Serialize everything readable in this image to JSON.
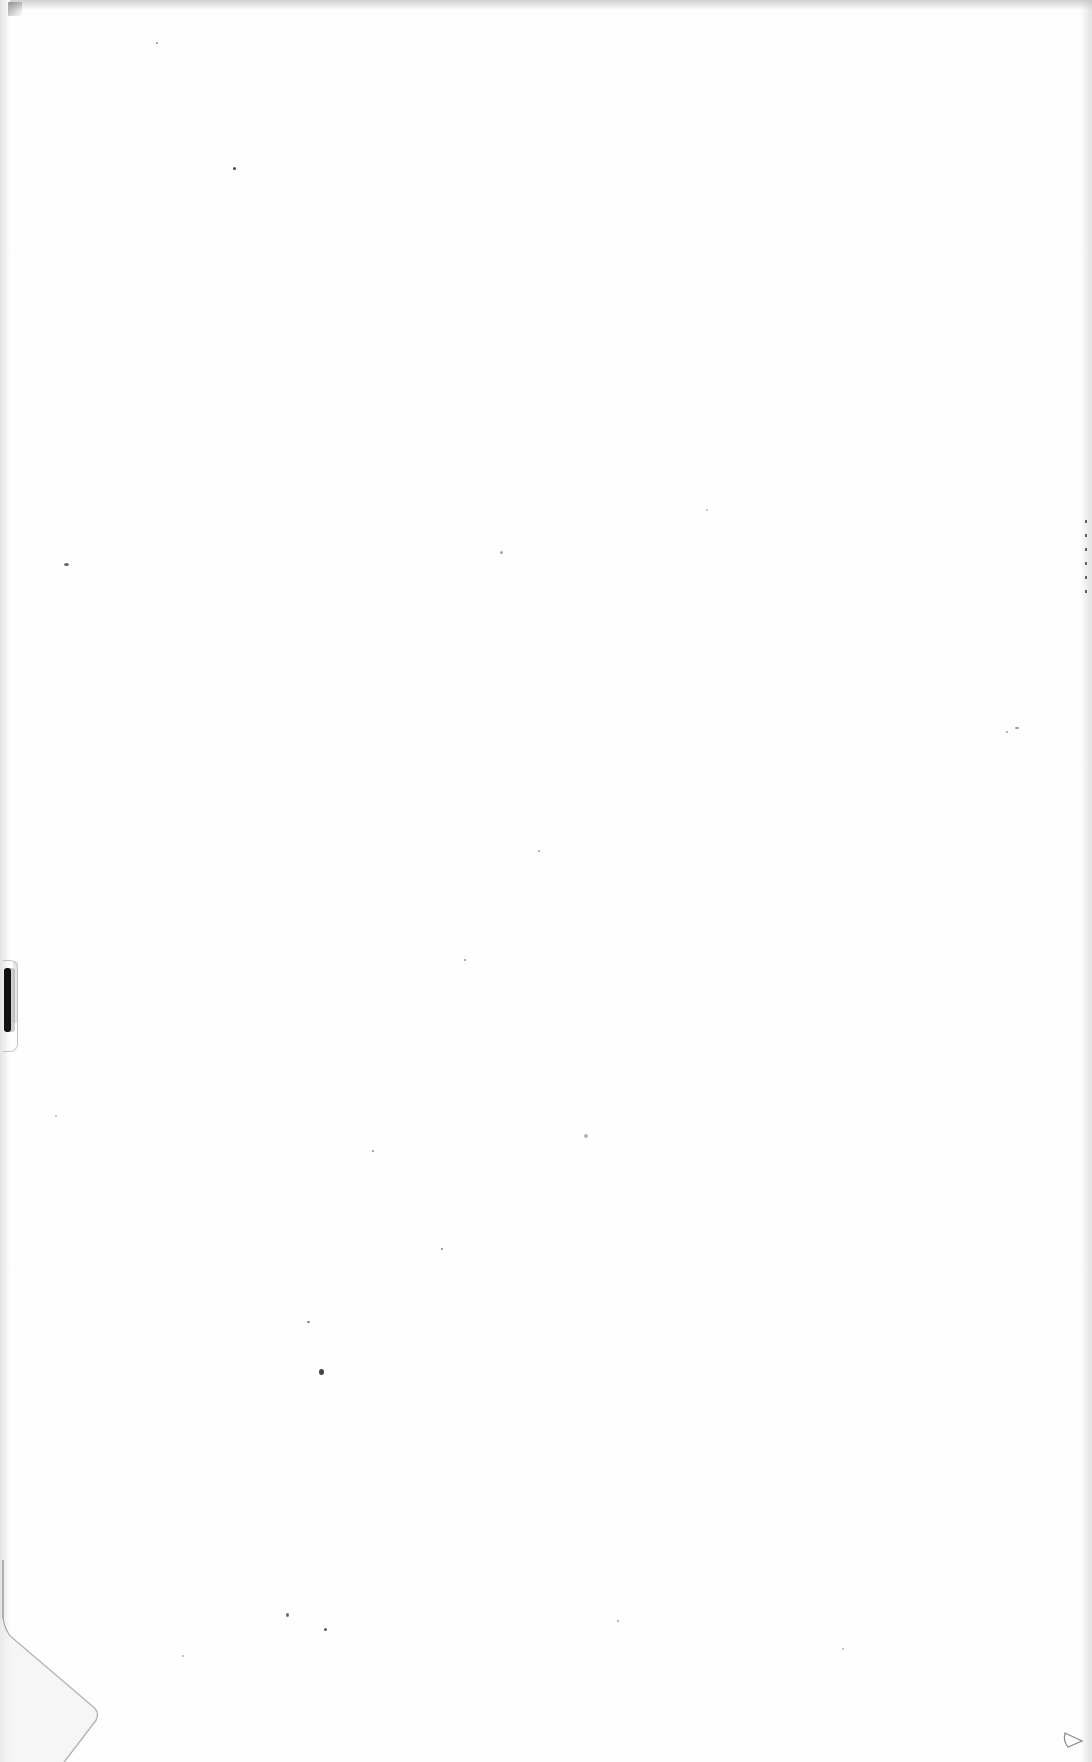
{
  "document": {
    "type": "blank-scanned-page",
    "text_content": [],
    "background_color": "#fefefe",
    "artifacts": {
      "binding_mark_color": "#111111",
      "edge_shadow_color": "#787878",
      "speck_color": "#444444"
    }
  }
}
